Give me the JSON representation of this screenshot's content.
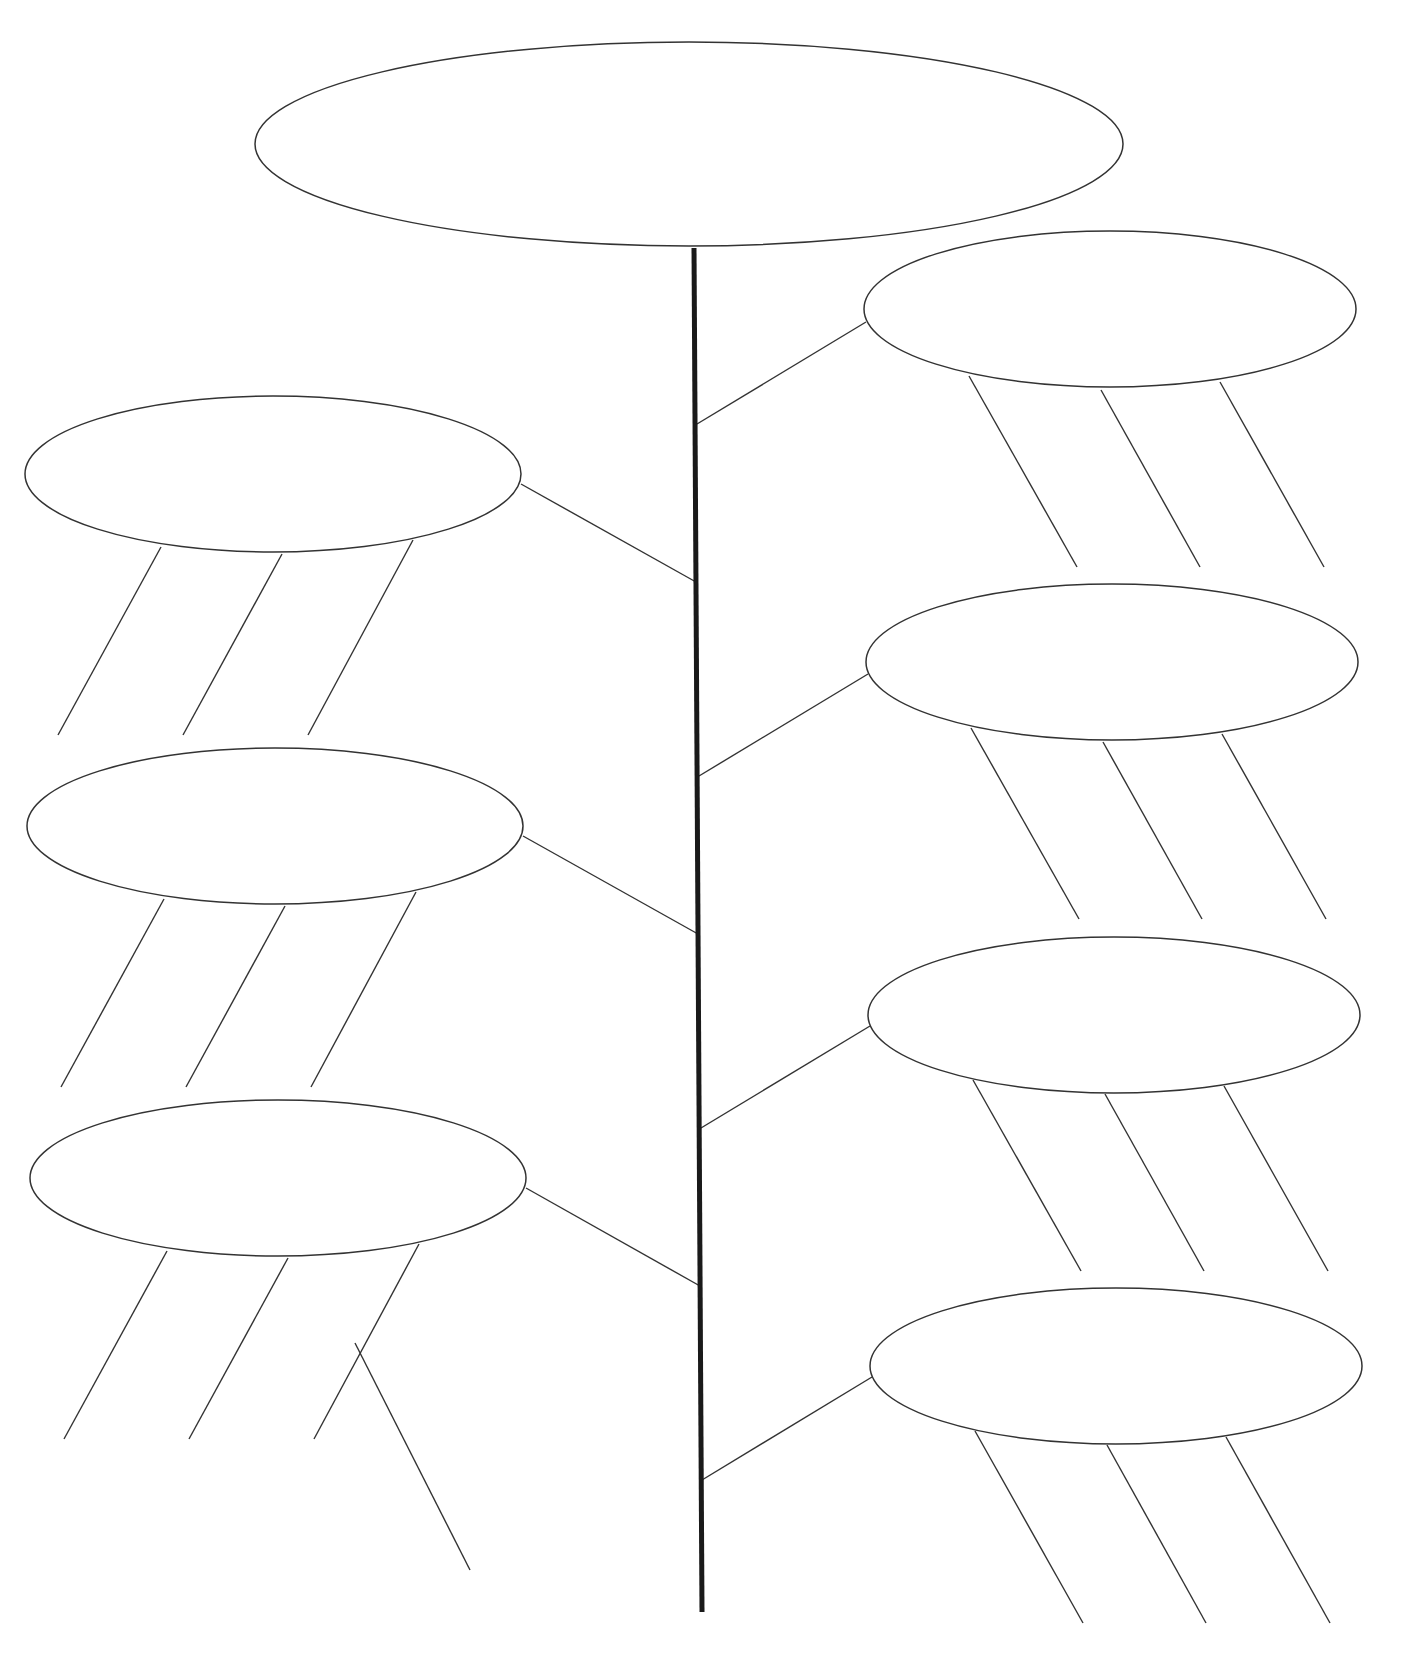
{
  "diagram": {
    "type": "tree-graphic-organizer",
    "canvas": {
      "width": 1409,
      "height": 1669,
      "background": "#ffffff",
      "stroke": "#333333"
    },
    "trunk": {
      "x1": 694,
      "y1": 248,
      "x2": 702,
      "y2": 1612
    },
    "nodes": [
      {
        "id": "main",
        "label": "",
        "cx": 689,
        "cy": 144,
        "rx": 434,
        "ry": 102
      },
      {
        "id": "left-1",
        "label": "",
        "cx": 273,
        "cy": 474,
        "rx": 248,
        "ry": 78
      },
      {
        "id": "left-2",
        "label": "",
        "cx": 275,
        "cy": 826,
        "rx": 248,
        "ry": 78
      },
      {
        "id": "left-3",
        "label": "",
        "cx": 278,
        "cy": 1178,
        "rx": 248,
        "ry": 78
      },
      {
        "id": "right-1",
        "label": "",
        "cx": 1110,
        "cy": 309,
        "rx": 246,
        "ry": 78
      },
      {
        "id": "right-2",
        "label": "",
        "cx": 1112,
        "cy": 662,
        "rx": 246,
        "ry": 78
      },
      {
        "id": "right-3",
        "label": "",
        "cx": 1114,
        "cy": 1015,
        "rx": 246,
        "ry": 78
      },
      {
        "id": "right-4",
        "label": "",
        "cx": 1116,
        "cy": 1366,
        "rx": 246,
        "ry": 78
      }
    ],
    "connectors": [
      {
        "from": "left-1",
        "x1": 521,
        "y1": 484,
        "x2": 696,
        "y2": 582
      },
      {
        "from": "left-2",
        "x1": 523,
        "y1": 836,
        "x2": 698,
        "y2": 934
      },
      {
        "from": "left-3",
        "x1": 526,
        "y1": 1188,
        "x2": 700,
        "y2": 1286
      },
      {
        "from": "right-1",
        "x1": 866,
        "y1": 322,
        "x2": 697,
        "y2": 424
      },
      {
        "from": "right-2",
        "x1": 868,
        "y1": 674,
        "x2": 699,
        "y2": 776
      },
      {
        "from": "right-3",
        "x1": 870,
        "y1": 1026,
        "x2": 701,
        "y2": 1128
      },
      {
        "from": "right-4",
        "x1": 872,
        "y1": 1377,
        "x2": 702,
        "y2": 1480
      }
    ],
    "detail_lines": [
      {
        "x1": 161,
        "y1": 547,
        "x2": 58,
        "y2": 735
      },
      {
        "x1": 282,
        "y1": 554,
        "x2": 183,
        "y2": 735
      },
      {
        "x1": 413,
        "y1": 540,
        "x2": 308,
        "y2": 735
      },
      {
        "x1": 164,
        "y1": 899,
        "x2": 61,
        "y2": 1087
      },
      {
        "x1": 285,
        "y1": 906,
        "x2": 186,
        "y2": 1087
      },
      {
        "x1": 416,
        "y1": 892,
        "x2": 311,
        "y2": 1087
      },
      {
        "x1": 167,
        "y1": 1251,
        "x2": 64,
        "y2": 1439
      },
      {
        "x1": 288,
        "y1": 1258,
        "x2": 189,
        "y2": 1439
      },
      {
        "x1": 419,
        "y1": 1244,
        "x2": 314,
        "y2": 1439
      },
      {
        "x1": 355,
        "y1": 1343,
        "x2": 470,
        "y2": 1570
      },
      {
        "x1": 969,
        "y1": 376,
        "x2": 1077,
        "y2": 567
      },
      {
        "x1": 1101,
        "y1": 390,
        "x2": 1200,
        "y2": 567
      },
      {
        "x1": 1220,
        "y1": 382,
        "x2": 1324,
        "y2": 567
      },
      {
        "x1": 971,
        "y1": 728,
        "x2": 1079,
        "y2": 919
      },
      {
        "x1": 1103,
        "y1": 742,
        "x2": 1202,
        "y2": 919
      },
      {
        "x1": 1222,
        "y1": 734,
        "x2": 1326,
        "y2": 919
      },
      {
        "x1": 973,
        "y1": 1080,
        "x2": 1081,
        "y2": 1271
      },
      {
        "x1": 1105,
        "y1": 1094,
        "x2": 1204,
        "y2": 1271
      },
      {
        "x1": 1224,
        "y1": 1086,
        "x2": 1328,
        "y2": 1271
      },
      {
        "x1": 975,
        "y1": 1431,
        "x2": 1083,
        "y2": 1623
      },
      {
        "x1": 1107,
        "y1": 1445,
        "x2": 1206,
        "y2": 1623
      },
      {
        "x1": 1226,
        "y1": 1437,
        "x2": 1330,
        "y2": 1623
      }
    ]
  }
}
